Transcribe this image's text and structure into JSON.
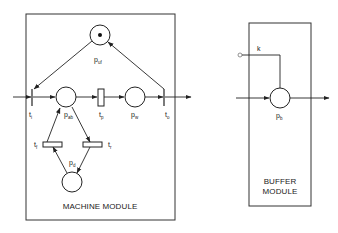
{
  "machine_module": {
    "title": "MACHINE MODULE",
    "places": {
      "uf": {
        "main": "p",
        "sub": "uf",
        "tokens": 1
      },
      "ab": {
        "main": "p",
        "sub": "ab",
        "tokens": 0
      },
      "w": {
        "main": "p",
        "sub": "w",
        "tokens": 0
      },
      "d": {
        "main": "p",
        "sub": "d",
        "tokens": 0
      }
    },
    "transitions": {
      "i": {
        "main": "t",
        "sub": "i"
      },
      "p": {
        "main": "t",
        "sub": "p"
      },
      "o": {
        "main": "t",
        "sub": "o"
      },
      "f": {
        "main": "t",
        "sub": "f"
      },
      "r": {
        "main": "t",
        "sub": "r"
      }
    }
  },
  "buffer_module": {
    "title_line1": "BUFFER",
    "title_line2": "MODULE",
    "place": {
      "main": "p",
      "sub": "b",
      "tokens": 0
    },
    "capacity_label": "k"
  },
  "colors": {
    "stroke": "#222222",
    "background": "#ffffff"
  }
}
